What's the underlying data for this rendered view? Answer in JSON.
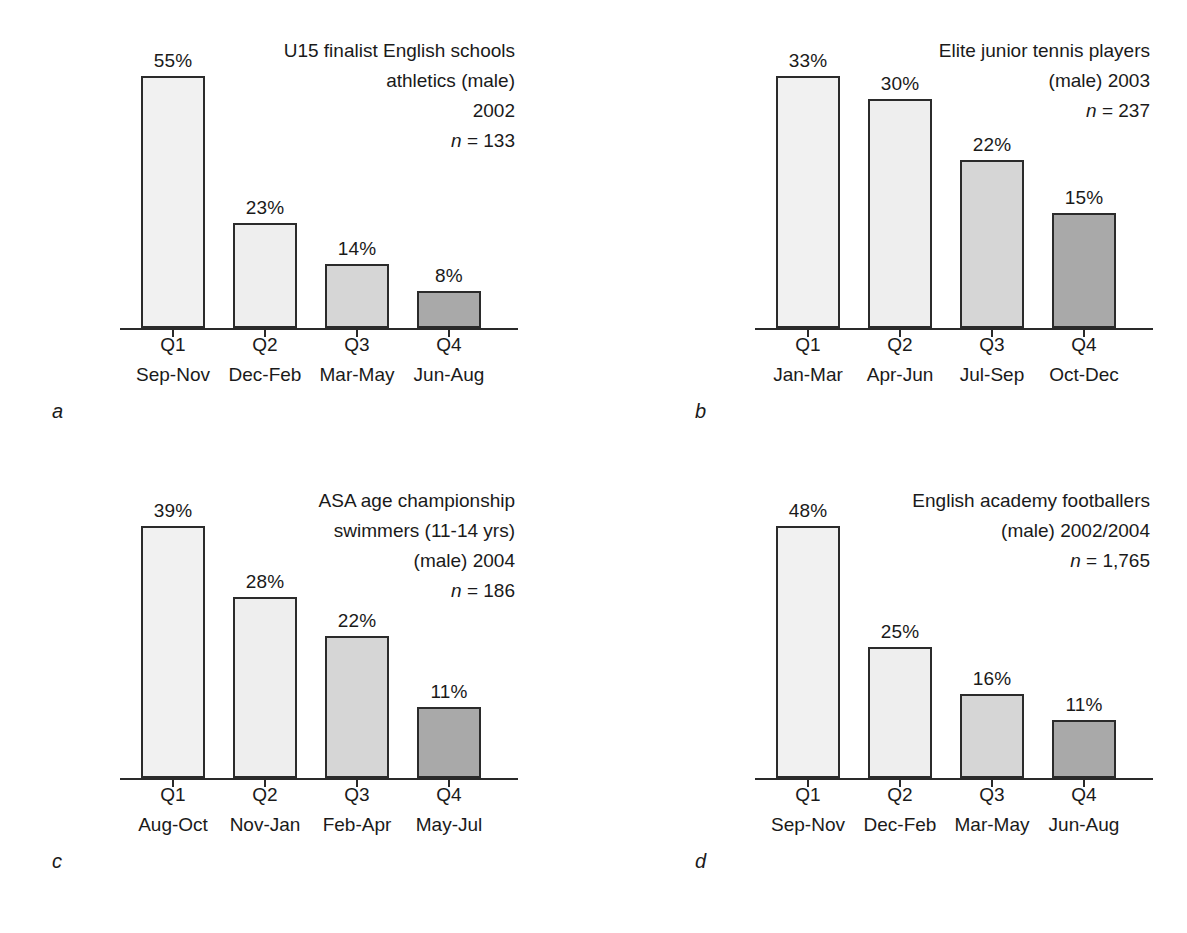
{
  "figure": {
    "panel_count": 4,
    "shared": {
      "axis_label_row1": "quarter",
      "axis_label_row2": "months"
    }
  },
  "colors": {
    "q1_fill": "#f1f1f1",
    "q2_fill": "#eeeeee",
    "q3_fill": "#d6d6d6",
    "q4_fill": "#a9a9a9",
    "outline": "#2b2b2b",
    "axis": "#2a2a2a",
    "text": "#1a1a1a",
    "background": "#ffffff"
  },
  "panels": [
    {
      "letter": "a",
      "title_lines": [
        "U15 finalist English schools",
        "athletics (male)",
        "2002"
      ],
      "n_prefix": "n",
      "n_equals": " = ",
      "n_value": "133",
      "n_line": "n = 133",
      "categories": [
        "Q1",
        "Q2",
        "Q3",
        "Q4"
      ],
      "months": [
        "Sep-Nov",
        "Dec-Feb",
        "Mar-May",
        "Jun-Aug"
      ],
      "values": [
        55,
        23,
        14,
        8
      ],
      "value_labels": [
        "55%",
        "23%",
        "14%",
        "8%"
      ]
    },
    {
      "letter": "b",
      "title_lines": [
        "Elite junior tennis players",
        "(male) 2003"
      ],
      "n_prefix": "n",
      "n_equals": " = ",
      "n_value": "237",
      "n_line": "n = 237",
      "categories": [
        "Q1",
        "Q2",
        "Q3",
        "Q4"
      ],
      "months": [
        "Jan-Mar",
        "Apr-Jun",
        "Jul-Sep",
        "Oct-Dec"
      ],
      "values": [
        33,
        30,
        22,
        15
      ],
      "value_labels": [
        "33%",
        "30%",
        "22%",
        "15%"
      ]
    },
    {
      "letter": "c",
      "title_lines": [
        "ASA age championship",
        "swimmers (11-14 yrs)",
        "(male) 2004"
      ],
      "n_prefix": "n",
      "n_equals": " = ",
      "n_value": "186",
      "n_line": "n = 186",
      "categories": [
        "Q1",
        "Q2",
        "Q3",
        "Q4"
      ],
      "months": [
        "Aug-Oct",
        "Nov-Jan",
        "Feb-Apr",
        "May-Jul"
      ],
      "values": [
        39,
        28,
        22,
        11
      ],
      "value_labels": [
        "39%",
        "28%",
        "22%",
        "11%"
      ]
    },
    {
      "letter": "d",
      "title_lines": [
        "English academy footballers",
        "(male) 2002/2004"
      ],
      "n_prefix": "n",
      "n_equals": " = ",
      "n_value": "1,765",
      "n_line": "n = 1,765",
      "categories": [
        "Q1",
        "Q2",
        "Q3",
        "Q4"
      ],
      "months": [
        "Sep-Nov",
        "Dec-Feb",
        "Mar-May",
        "Jun-Aug"
      ],
      "values": [
        48,
        25,
        16,
        11
      ],
      "value_labels": [
        "48%",
        "25%",
        "16%",
        "11%"
      ]
    }
  ],
  "chart_data": [
    {
      "type": "bar",
      "panel": "a",
      "title": "U15 finalist English schools athletics (male) 2002",
      "subtitle": "n = 133",
      "sample_size": 133,
      "categories": [
        "Q1",
        "Q2",
        "Q3",
        "Q4"
      ],
      "category_sublabels": [
        "Sep-Nov",
        "Dec-Feb",
        "Mar-May",
        "Jun-Aug"
      ],
      "values": [
        55,
        23,
        14,
        8
      ],
      "data_labels": [
        "55%",
        "23%",
        "14%",
        "8%"
      ],
      "units": "percent",
      "xlabel": "",
      "ylabel": "",
      "ylim": [
        0,
        55
      ],
      "grid": false,
      "legend": false,
      "axis_visible": "x-only"
    },
    {
      "type": "bar",
      "panel": "b",
      "title": "Elite junior tennis players (male) 2003",
      "subtitle": "n = 237",
      "sample_size": 237,
      "categories": [
        "Q1",
        "Q2",
        "Q3",
        "Q4"
      ],
      "category_sublabels": [
        "Jan-Mar",
        "Apr-Jun",
        "Jul-Sep",
        "Oct-Dec"
      ],
      "values": [
        33,
        30,
        22,
        15
      ],
      "data_labels": [
        "33%",
        "30%",
        "22%",
        "15%"
      ],
      "units": "percent",
      "xlabel": "",
      "ylabel": "",
      "ylim": [
        0,
        33
      ],
      "grid": false,
      "legend": false,
      "axis_visible": "x-only"
    },
    {
      "type": "bar",
      "panel": "c",
      "title": "ASA age championship swimmers (11-14 yrs) (male) 2004",
      "subtitle": "n = 186",
      "sample_size": 186,
      "categories": [
        "Q1",
        "Q2",
        "Q3",
        "Q4"
      ],
      "category_sublabels": [
        "Aug-Oct",
        "Nov-Jan",
        "Feb-Apr",
        "May-Jul"
      ],
      "values": [
        39,
        28,
        22,
        11
      ],
      "data_labels": [
        "39%",
        "28%",
        "22%",
        "11%"
      ],
      "units": "percent",
      "xlabel": "",
      "ylabel": "",
      "ylim": [
        0,
        39
      ],
      "grid": false,
      "legend": false,
      "axis_visible": "x-only"
    },
    {
      "type": "bar",
      "panel": "d",
      "title": "English academy footballers (male) 2002/2004",
      "subtitle": "n = 1,765",
      "sample_size": 1765,
      "categories": [
        "Q1",
        "Q2",
        "Q3",
        "Q4"
      ],
      "category_sublabels": [
        "Sep-Nov",
        "Dec-Feb",
        "Mar-May",
        "Jun-Aug"
      ],
      "values": [
        48,
        25,
        16,
        11
      ],
      "data_labels": [
        "48%",
        "25%",
        "16%",
        "11%"
      ],
      "units": "percent",
      "xlabel": "",
      "ylabel": "",
      "ylim": [
        0,
        48
      ],
      "grid": false,
      "legend": false,
      "axis_visible": "x-only"
    }
  ]
}
